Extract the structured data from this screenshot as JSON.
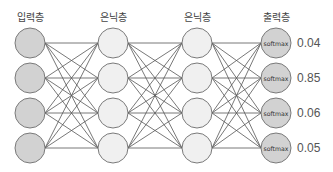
{
  "diagram": {
    "type": "fully-connected-neural-network",
    "layers": [
      {
        "label": "입력층",
        "role": "input",
        "nodes": 4,
        "fill": "#d2d2d2"
      },
      {
        "label": "은닉층",
        "role": "hidden",
        "nodes": 4,
        "fill": "#f0f0f0"
      },
      {
        "label": "은닉층",
        "role": "hidden",
        "nodes": 4,
        "fill": "#f0f0f0"
      },
      {
        "label": "출력층",
        "role": "output",
        "nodes": 4,
        "fill": "#d2d2d2",
        "node_text": "softmax"
      }
    ],
    "outputs": [
      "0.04",
      "0.85",
      "0.06",
      "0.05"
    ],
    "colors": {
      "stroke": "#7a7a7a",
      "edge": "#555555"
    }
  }
}
